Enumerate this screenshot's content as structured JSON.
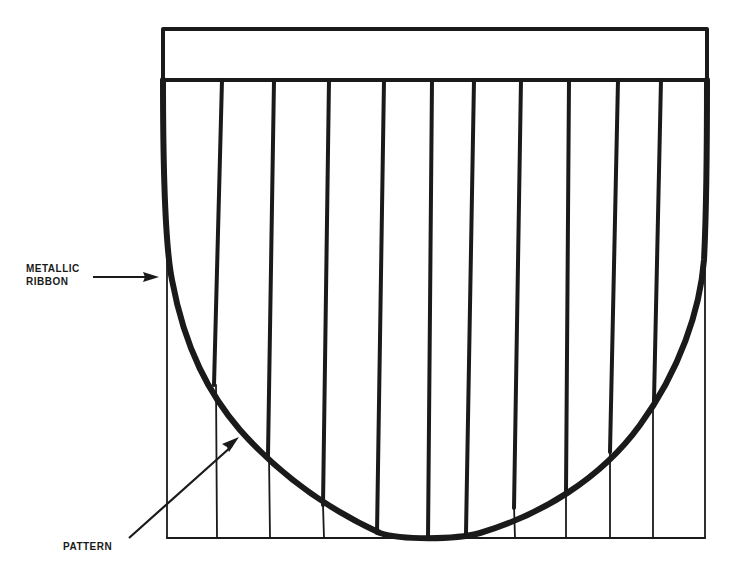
{
  "diagram": {
    "title": "",
    "labels": {
      "metallic_ribbon_line1": "METALLIC",
      "metallic_ribbon_line2": "RIBBON",
      "pattern": "PATTERN"
    },
    "colors": {
      "ink": "#1a1a1a",
      "background": "#ffffff"
    },
    "elements": {
      "top_band": {
        "x": 162,
        "y": 28,
        "width": 545,
        "height": 52
      },
      "vertical_ribs_count": 10,
      "pattern_cells_count": 11,
      "curve": "U-shaped metallic ribbon outline from top-left to top-right, bottoming at center"
    }
  }
}
